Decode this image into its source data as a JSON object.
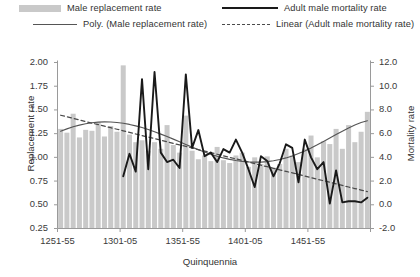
{
  "legend": {
    "items": [
      {
        "key": "bars",
        "label": "Male replacement rate",
        "marker": "bar-swatch"
      },
      {
        "key": "poly",
        "label": "Poly. (Male replacement rate)",
        "marker": "thin-line"
      },
      {
        "key": "line",
        "label": "Adult male mortality rate",
        "marker": "thick-line"
      },
      {
        "key": "linear",
        "label": "Linear (Adult male mortality rate)",
        "marker": "dashed-line"
      }
    ]
  },
  "axes": {
    "y_left_title": "Replacement rate",
    "y_right_title": "Mortality rate",
    "x_title": "Quinquennia",
    "y_left_ticks": [
      "2.00",
      "1.75",
      "1.50",
      "1.25",
      "1.00",
      "0.75",
      "0.50",
      "0.25"
    ],
    "y_right_ticks": [
      "12.0",
      "10.0",
      "8.0",
      "6.0",
      "4.0",
      "2.0",
      "0.0",
      "-2.0"
    ],
    "x_ticks": [
      "1251-55",
      "1301-05",
      "1351-55",
      "1401-05",
      "1451-55"
    ]
  },
  "colors": {
    "bar_fill": "#c9c9c9",
    "mortality_line": "#1a1a1a",
    "poly_trend": "#555555",
    "linear_trend": "#4a4a4a",
    "axis": "#9a9a9a",
    "text": "#333333",
    "background": "#ffffff"
  },
  "chart_data": {
    "type": "bar",
    "title": "",
    "subtitle": "",
    "xlabel": "Quinquennia",
    "ylabel": "Replacement rate",
    "y2label": "Mortality rate",
    "ylim": [
      0.25,
      2.0
    ],
    "y2lim": [
      -2.0,
      12.0
    ],
    "ytick_step": 0.25,
    "y2tick_step": 2.0,
    "grid": false,
    "legend_position": "top",
    "categories": [
      "1251-55",
      "1256-60",
      "1261-65",
      "1266-70",
      "1271-75",
      "1276-80",
      "1281-85",
      "1286-90",
      "1291-95",
      "1296-1300",
      "1301-05",
      "1306-10",
      "1311-15",
      "1316-20",
      "1321-25",
      "1326-30",
      "1331-35",
      "1336-40",
      "1341-45",
      "1346-50",
      "1351-55",
      "1356-60",
      "1361-65",
      "1366-70",
      "1371-75",
      "1376-80",
      "1381-85",
      "1386-90",
      "1391-95",
      "1396-1400",
      "1401-05",
      "1406-10",
      "1411-15",
      "1416-20",
      "1421-25",
      "1426-30",
      "1431-35",
      "1436-40",
      "1441-45",
      "1446-50",
      "1451-55",
      "1456-60",
      "1461-65",
      "1466-70",
      "1471-75",
      "1476-80",
      "1481-85",
      "1486-90",
      "1491-95",
      "1496-1500"
    ],
    "series": [
      {
        "name": "Male replacement rate",
        "type": "bar",
        "axis": "left",
        "color": "#c9c9c9",
        "values": [
          1.3,
          1.26,
          1.46,
          1.21,
          1.29,
          1.28,
          1.37,
          1.22,
          1.33,
          1.27,
          1.97,
          1.24,
          1.16,
          1.18,
          1.07,
          1.16,
          1.09,
          1.34,
          1.13,
          1.05,
          1.44,
          1.07,
          0.98,
          1.02,
          0.96,
          1.11,
          0.97,
          0.94,
          1.02,
          1.05,
          0.9,
          1.0,
          0.93,
          1.01,
          0.89,
          0.93,
          1.09,
          1.02,
          0.95,
          1.09,
          1.23,
          1.0,
          1.17,
          1.14,
          1.3,
          1.09,
          1.34,
          1.16,
          1.27,
          1.48
        ]
      },
      {
        "name": "Adult male mortality rate",
        "type": "line",
        "axis": "right",
        "color": "#1a1a1a",
        "values": [
          null,
          null,
          null,
          null,
          null,
          null,
          null,
          null,
          null,
          null,
          2.4,
          4.3,
          2.8,
          10.6,
          3.0,
          11.2,
          4.4,
          3.6,
          3.8,
          3.1,
          11.0,
          4.8,
          6.3,
          4.1,
          4.4,
          3.6,
          4.7,
          4.4,
          5.5,
          4.4,
          3.0,
          1.5,
          4.1,
          3.7,
          2.4,
          3.5,
          5.1,
          4.8,
          1.9,
          5.5,
          4.0,
          3.0,
          3.6,
          0.1,
          2.9,
          0.2,
          0.3,
          0.3,
          0.2,
          0.6
        ]
      },
      {
        "name": "Poly. (Male replacement rate)",
        "type": "line",
        "style": "solid-thin",
        "axis": "left",
        "color": "#555555",
        "values": [
          1.275,
          1.3,
          1.322,
          1.34,
          1.354,
          1.365,
          1.371,
          1.374,
          1.373,
          1.368,
          1.359,
          1.347,
          1.332,
          1.314,
          1.293,
          1.27,
          1.245,
          1.219,
          1.192,
          1.164,
          1.136,
          1.108,
          1.081,
          1.056,
          1.033,
          1.012,
          0.994,
          0.979,
          0.967,
          0.958,
          0.952,
          0.949,
          0.95,
          0.955,
          0.964,
          0.977,
          0.994,
          1.015,
          1.04,
          1.068,
          1.099,
          1.132,
          1.167,
          1.203,
          1.24,
          1.276,
          1.31,
          1.341,
          1.367,
          1.386
        ]
      },
      {
        "name": "Linear (Adult male mortality rate)",
        "type": "line",
        "style": "dashed",
        "axis": "right",
        "color": "#4a4a4a",
        "values": [
          7.55,
          7.42,
          7.29,
          7.16,
          7.02,
          6.89,
          6.76,
          6.63,
          6.5,
          6.37,
          6.24,
          6.1,
          5.97,
          5.84,
          5.71,
          5.58,
          5.45,
          5.32,
          5.18,
          5.05,
          4.92,
          4.79,
          4.66,
          4.53,
          4.4,
          4.26,
          4.13,
          4.0,
          3.87,
          3.74,
          3.61,
          3.48,
          3.34,
          3.21,
          3.08,
          2.95,
          2.82,
          2.69,
          2.56,
          2.42,
          2.29,
          2.16,
          2.03,
          1.9,
          1.77,
          1.64,
          1.5,
          1.37,
          1.24,
          1.11
        ]
      }
    ],
    "annotations": []
  }
}
